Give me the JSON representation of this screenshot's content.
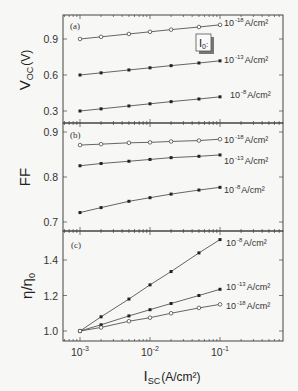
{
  "chart_data": [
    {
      "type": "line",
      "panel": "(a)",
      "title": "",
      "xlabel": "",
      "ylabel": "V_OC (V)",
      "xscale": "log",
      "xlim": [
        0.0006,
        0.3
      ],
      "ylim": [
        0.2,
        1.08
      ],
      "yticks": [
        0.3,
        0.6,
        0.9
      ],
      "ytick_labels": [
        "0.3",
        "0.6",
        "0.9"
      ],
      "x": [
        0.001,
        0.002,
        0.005,
        0.01,
        0.02,
        0.05,
        0.1
      ],
      "annotation": "I0:",
      "series": [
        {
          "name": "10^-18 A/cm²",
          "marker": "open-circle",
          "values": [
            0.9,
            0.918,
            0.942,
            0.96,
            0.978,
            1.0,
            1.018
          ]
        },
        {
          "name": "10^-13 A/cm²",
          "marker": "filled-square",
          "values": [
            0.6,
            0.618,
            0.642,
            0.66,
            0.678,
            0.7,
            0.718
          ]
        },
        {
          "name": "10^-8 A/cm²",
          "marker": "filled-square",
          "values": [
            0.3,
            0.318,
            0.342,
            0.36,
            0.378,
            0.4,
            0.418
          ]
        }
      ]
    },
    {
      "type": "line",
      "panel": "(b)",
      "title": "",
      "xlabel": "",
      "ylabel": "FF",
      "xscale": "log",
      "xlim": [
        0.0006,
        0.3
      ],
      "ylim": [
        0.68,
        0.92
      ],
      "yticks": [
        0.7,
        0.8,
        0.9
      ],
      "ytick_labels": [
        "0.7",
        "0.8",
        "0.9"
      ],
      "x": [
        0.001,
        0.002,
        0.005,
        0.01,
        0.02,
        0.05,
        0.1
      ],
      "series": [
        {
          "name": "10^-18 A/cm²",
          "marker": "open-circle",
          "values": [
            0.871,
            0.873,
            0.876,
            0.877,
            0.879,
            0.881,
            0.884
          ]
        },
        {
          "name": "10^-13 A/cm²",
          "marker": "filled-square",
          "values": [
            0.825,
            0.83,
            0.835,
            0.839,
            0.843,
            0.846,
            0.849
          ]
        },
        {
          "name": "10^-8 A/cm²",
          "marker": "filled-square",
          "values": [
            0.721,
            0.732,
            0.746,
            0.754,
            0.762,
            0.771,
            0.777
          ]
        }
      ]
    },
    {
      "type": "line",
      "panel": "(c)",
      "title": "",
      "xlabel": "I_SC (A/cm²)",
      "ylabel": "η/η0",
      "xscale": "log",
      "xlim": [
        0.0006,
        0.3
      ],
      "ylim": [
        0.96,
        1.56
      ],
      "yticks": [
        1.0,
        1.2,
        1.4
      ],
      "ytick_labels": [
        "1.0",
        "1.2",
        "1.4"
      ],
      "xticks": [
        0.001,
        0.01,
        0.1
      ],
      "xtick_labels": [
        "10^-3",
        "10^-2",
        "10^-1"
      ],
      "x": [
        0.001,
        0.002,
        0.005,
        0.01,
        0.02,
        0.05,
        0.1
      ],
      "series": [
        {
          "name": "10^-8 A/cm²",
          "marker": "filled-square",
          "values": [
            1.0,
            1.08,
            1.18,
            1.26,
            1.335,
            1.44,
            1.515
          ]
        },
        {
          "name": "10^-13 A/cm²",
          "marker": "filled-square",
          "values": [
            1.0,
            1.035,
            1.085,
            1.12,
            1.155,
            1.2,
            1.235
          ]
        },
        {
          "name": "10^-18 A/cm²",
          "marker": "open-circle",
          "values": [
            1.0,
            1.02,
            1.055,
            1.075,
            1.1,
            1.13,
            1.15
          ]
        }
      ]
    }
  ],
  "labels": {
    "panel_a": "(a)",
    "panel_b": "(b)",
    "panel_c": "(c)",
    "ylabel_a_main": "V",
    "ylabel_a_sub": "OC",
    "ylabel_a_unit": "(V)",
    "ylabel_b": "FF",
    "ylabel_c_main": "η/η",
    "ylabel_c_sub": "0",
    "xlabel_main": "I",
    "xlabel_sub": "SC",
    "xlabel_unit": "(A/cm²)",
    "annotation_main": "I",
    "annotation_sub": "0",
    "annotation_colon": ":",
    "series_prefix": "10",
    "series_unit": "A/cm²",
    "exp_18": "-18",
    "exp_13": "-13",
    "exp_8": "-8",
    "xtick_base": "10",
    "xtick_exp": [
      "-3",
      "-2",
      "-1"
    ]
  },
  "colors": {
    "line": "#555555",
    "frame": "#444444",
    "background": "#f7f7f5",
    "box_shadow": "#777777"
  }
}
